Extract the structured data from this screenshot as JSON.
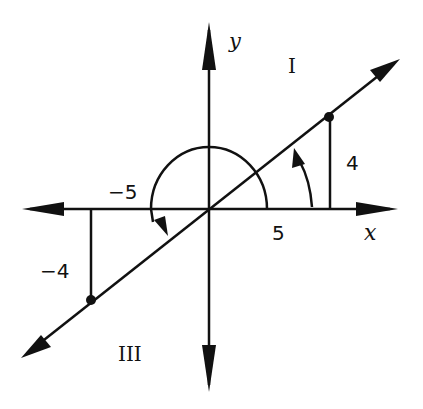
{
  "diagram": {
    "axes": {
      "x_label": "x",
      "y_label": "y"
    },
    "quadrants": {
      "first": "I",
      "third": "III"
    },
    "labels": {
      "pos_x": "5",
      "pos_y": "4",
      "neg_x": "−5",
      "neg_y": "−4"
    },
    "points": [
      {
        "name": "P",
        "x": 5,
        "y": 4
      },
      {
        "name": "Q",
        "x": -5,
        "y": -4
      }
    ],
    "angles": [
      {
        "name": "theta",
        "description": "acute angle from positive x-axis to terminal side in quadrant I"
      },
      {
        "name": "theta-plus-180",
        "description": "angle from positive x-axis counterclockwise to terminal side in quadrant III"
      }
    ],
    "colors": {
      "ink": "#111111",
      "background": "#ffffff"
    }
  }
}
